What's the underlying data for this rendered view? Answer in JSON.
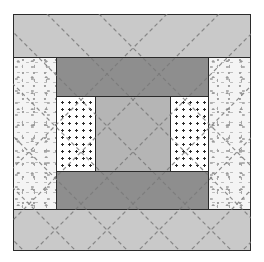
{
  "diagram": {
    "type": "quilt-block",
    "colors": {
      "outer_band": "#c9c9c9",
      "inner_band": "#8e8e8e",
      "center": "#b5b5b5",
      "dotted_background": "#ffffff",
      "dot": "#2a2a2a",
      "floral_background": "#f4f4f4",
      "seam": "#2a2a2a",
      "quilting_line": "#7a7a7a"
    },
    "pieces": [
      {
        "id": "top-band",
        "fabric": "light-solid"
      },
      {
        "id": "bottom-band",
        "fabric": "light-solid"
      },
      {
        "id": "left-side",
        "fabric": "floral-print"
      },
      {
        "id": "right-side",
        "fabric": "floral-print"
      },
      {
        "id": "inner-top-band",
        "fabric": "dark-solid"
      },
      {
        "id": "inner-bottom-band",
        "fabric": "dark-solid"
      },
      {
        "id": "inner-left",
        "fabric": "polka-dot"
      },
      {
        "id": "inner-right",
        "fabric": "polka-dot"
      },
      {
        "id": "center-square",
        "fabric": "medium-solid"
      }
    ],
    "quilting": {
      "style": "diagonal-crosshatch-dashed",
      "angle_deg": 45
    }
  }
}
